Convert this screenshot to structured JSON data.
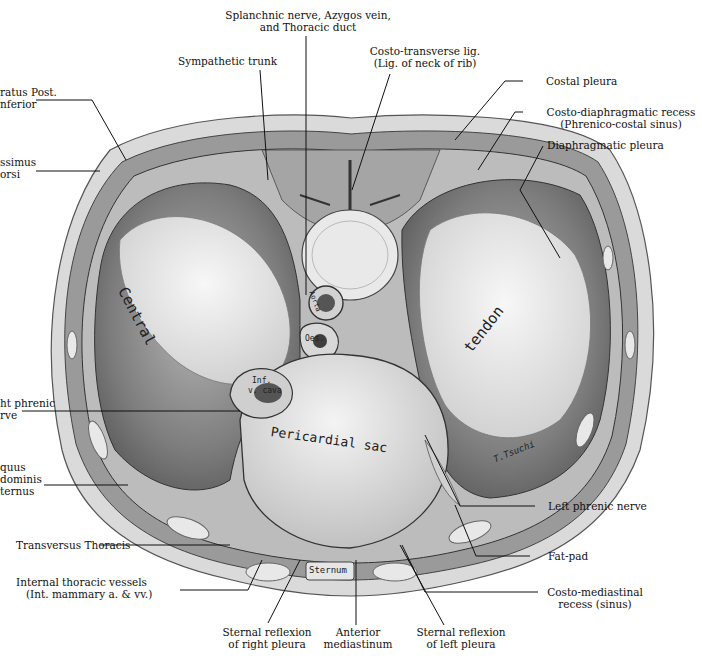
{
  "figure": {
    "colors": {
      "background": "#ffffff",
      "skin": "#d9d9d9",
      "muscle": "#8a8a8a",
      "tendon": "#ececec",
      "pericardium": "#e4e4e4",
      "dark_tissue": "#5a5a5a",
      "line": "#111111"
    }
  },
  "labels": {
    "splanchnic": {
      "line1": "Splanchnic nerve, Azygos vein,",
      "line2": "and Thoracic duct"
    },
    "sympathetic": {
      "line1": "Sympathetic trunk"
    },
    "costo_transverse": {
      "line1": "Costo-transverse lig.",
      "line2": "(Lig. of neck of rib)"
    },
    "serratus": {
      "line1": "ratus Post.",
      "line2": "nferior"
    },
    "latissimus": {
      "line1": "ssimus",
      "line2": "orsi"
    },
    "costal_pleura": {
      "line1": "Costal pleura"
    },
    "costo_diaphragmatic": {
      "line1": "Costo-diaphragmatic recess",
      "line2": "(Phrenico-costal sinus)"
    },
    "diaphragmatic_pleura": {
      "line1": "Diaphragmatic pleura"
    },
    "right_phrenic": {
      "line1": "ht phrenic",
      "line2": "rve"
    },
    "obliquus": {
      "line1": "quus",
      "line2": "dominis",
      "line3": "ternus"
    },
    "left_phrenic": {
      "line1": "Left phrenic nerve"
    },
    "fat_pad": {
      "line1": "Fat-pad"
    },
    "costo_mediastinal": {
      "line1": "Costo-mediastinal",
      "line2": "recess (sinus)"
    },
    "transversus": {
      "line1": "Transversus Thoracis"
    },
    "internal_thoracic": {
      "line1": "Internal thoracic vessels",
      "line2": "(Int. mammary a.  & vv.)"
    },
    "sternal_right": {
      "line1": "Sternal reflexion",
      "line2": "of right pleura"
    },
    "anterior_mediastinum": {
      "line1": "Anterior",
      "line2": "mediastinum"
    },
    "sternal_left": {
      "line1": "Sternal reflexion",
      "line2": "of left pleura"
    }
  },
  "inscriptions": {
    "central": "Central",
    "tendon": "tendon",
    "pericardial": "Pericardial sac",
    "ivc_line1": "Inf.",
    "ivc_line2": "v. cava",
    "aorta": "Aorta",
    "oesoph": "Oes.",
    "sternum": "Sternum",
    "signature": "T.Tsuchi"
  }
}
